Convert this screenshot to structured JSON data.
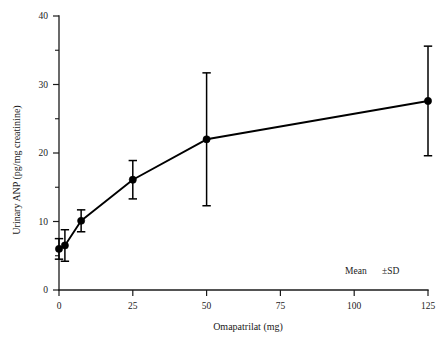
{
  "chart_data": {
    "type": "line",
    "title": "",
    "xlabel": "Omapatrilat (mg)",
    "ylabel": "Urinary ANP (pg/mg creatinine)",
    "xlim": [
      0,
      125
    ],
    "ylim": [
      0,
      40
    ],
    "grid": false,
    "legend_position": "inside-bottom-right",
    "annotation": "Mean   ±SD",
    "annotation_parts": {
      "mean": "Mean",
      "sd": "±SD"
    },
    "xticks": [
      0,
      25,
      50,
      75,
      100,
      125
    ],
    "xticklabels": [
      "0",
      "25",
      "50",
      "75",
      "100",
      "125"
    ],
    "yticks": [
      0,
      10,
      20,
      30,
      40
    ],
    "yticklabels": [
      "0",
      "10",
      "20",
      "30",
      "40"
    ],
    "yticks_minor": [
      5,
      15,
      25,
      35
    ],
    "error_type": "SD",
    "marker": "filled-circle",
    "series": [
      {
        "name": "Urinary ANP",
        "x": [
          0,
          2,
          7.5,
          25,
          50,
          125
        ],
        "values": [
          6.0,
          6.5,
          10.1,
          16.1,
          22.0,
          27.6
        ],
        "errors": [
          1.5,
          2.3,
          1.6,
          2.8,
          9.7,
          8.0
        ]
      }
    ]
  }
}
